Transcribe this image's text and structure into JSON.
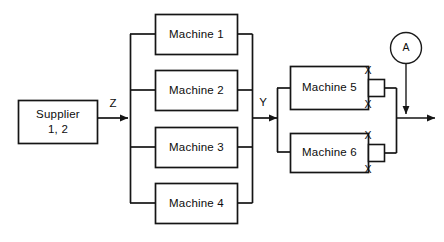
{
  "diagram": {
    "colors": {
      "stroke": "#151515",
      "background": "#ffffff",
      "text": "#0d0d0d"
    },
    "supplier": {
      "line1": "Supplier",
      "line2": "1, 2"
    },
    "flow_labels": {
      "supplier_to_stage1": "Z",
      "stage1_to_stage2": "Y"
    },
    "stage1": {
      "machines": [
        {
          "label": "Machine 1"
        },
        {
          "label": "Machine 2"
        },
        {
          "label": "Machine 3"
        },
        {
          "label": "Machine 4"
        }
      ]
    },
    "stage2": {
      "machines": [
        {
          "label": "Machine 5",
          "port_top_label": "X",
          "port_bottom_label": "X"
        },
        {
          "label": "Machine 6",
          "port_top_label": "X",
          "port_bottom_label": "X"
        }
      ]
    },
    "inspection_node": {
      "label": "A"
    }
  }
}
